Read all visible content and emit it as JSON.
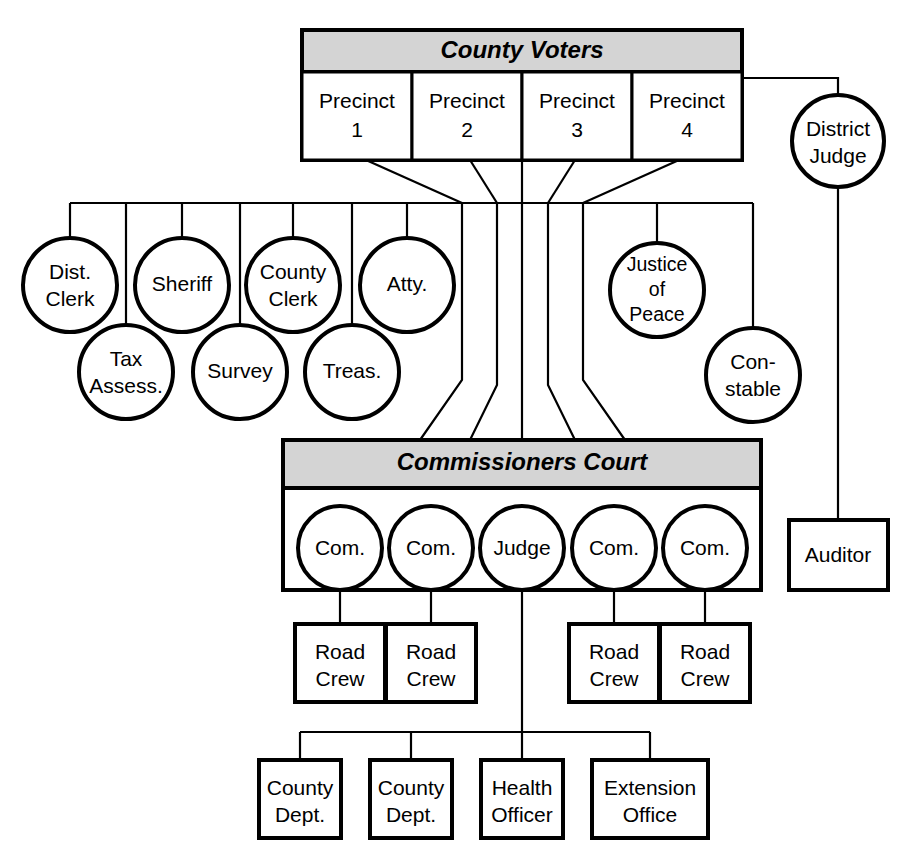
{
  "diagram": {
    "colors": {
      "banner_fill": "#d4d4d4",
      "node_fill": "#ffffff",
      "stroke": "#000000",
      "background": "#ffffff"
    }
  },
  "voters": {
    "banner_label": "County Voters",
    "precincts": [
      {
        "line1": "Precinct",
        "line2": "1"
      },
      {
        "line1": "Precinct",
        "line2": "2"
      },
      {
        "line1": "Precinct",
        "line2": "3"
      },
      {
        "line1": "Precinct",
        "line2": "4"
      }
    ]
  },
  "elected_officials": {
    "top_row": [
      {
        "line1": "Dist.",
        "line2": "Clerk"
      },
      {
        "line1": "Sheriff",
        "line2": ""
      },
      {
        "line1": "County",
        "line2": "Clerk"
      },
      {
        "line1": "Atty.",
        "line2": ""
      }
    ],
    "bottom_row": [
      {
        "line1": "Tax",
        "line2": "Assess."
      },
      {
        "line1": "Survey",
        "line2": ""
      },
      {
        "line1": "Treas.",
        "line2": ""
      }
    ]
  },
  "judicial": {
    "district_judge": {
      "line1": "District",
      "line2": "Judge"
    },
    "justice_of_peace": {
      "line1": "Justice",
      "line2": "of",
      "line3": "Peace"
    },
    "constable": {
      "line1": "Con-",
      "line2": "stable"
    },
    "auditor": {
      "line1": "Auditor",
      "line2": ""
    }
  },
  "commissioners_court": {
    "banner_label": "Commissioners Court",
    "members": [
      {
        "label": "Com."
      },
      {
        "label": "Com."
      },
      {
        "label": "Judge"
      },
      {
        "label": "Com."
      },
      {
        "label": "Com."
      }
    ]
  },
  "road_crews": [
    {
      "line1": "Road",
      "line2": "Crew"
    },
    {
      "line1": "Road",
      "line2": "Crew"
    },
    {
      "line1": "Road",
      "line2": "Crew"
    },
    {
      "line1": "Road",
      "line2": "Crew"
    }
  ],
  "departments": [
    {
      "line1": "County",
      "line2": "Dept."
    },
    {
      "line1": "County",
      "line2": "Dept."
    },
    {
      "line1": "Health",
      "line2": "Officer"
    },
    {
      "line1": "Extension",
      "line2": "Office"
    }
  ]
}
